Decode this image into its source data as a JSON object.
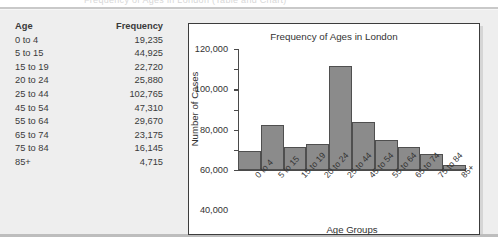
{
  "page": {
    "ghost_top_text": "Frequency of Ages in London (Table and Chart)"
  },
  "table": {
    "headers": [
      "Age",
      "Frequency"
    ],
    "rows": [
      {
        "age": "0 to 4",
        "frequency": "19,235"
      },
      {
        "age": "5 to 15",
        "frequency": "44,925"
      },
      {
        "age": "15 to 19",
        "frequency": "22,720"
      },
      {
        "age": "20 to 24",
        "frequency": "25,880"
      },
      {
        "age": "25 to 44",
        "frequency": "102,765"
      },
      {
        "age": "45 to 54",
        "frequency": "47,310"
      },
      {
        "age": "55 to 64",
        "frequency": "29,670"
      },
      {
        "age": "65 to 74",
        "frequency": "23,175"
      },
      {
        "age": "75 to 84",
        "frequency": "16,145"
      },
      {
        "age": "85+",
        "frequency": "4,715"
      }
    ]
  },
  "chart_data": {
    "type": "bar",
    "title": "Frequency of Ages in London",
    "xlabel": "Age Groups",
    "ylabel": "Number of Cases",
    "categories": [
      "0 to 4",
      "5 to 15",
      "15 to 19",
      "20 to 24",
      "25 to 44",
      "45 to 54",
      "55 to 64",
      "65 to 74",
      "75 to 84",
      "85+"
    ],
    "values": [
      19235,
      44925,
      22720,
      25880,
      102765,
      47310,
      29670,
      23175,
      16145,
      4715
    ],
    "ylim": [
      0,
      120000
    ],
    "ytick_values": [
      0,
      20000,
      40000,
      60000,
      80000,
      100000,
      120000
    ],
    "ytick_labels": [
      "0",
      "20,000",
      "40,000",
      "60,000",
      "80,000",
      "100,000",
      "120,000"
    ],
    "grid": false,
    "legend": false,
    "bar_color": "#8b8b8b",
    "bar_edge_color": "#4f4f4f",
    "contiguous_bars": true,
    "xtick_rotation_deg": -47
  },
  "colors": {
    "panel_bg": "#eeeeee",
    "card_bg": "#ffffff",
    "card_border": "#3c3c3c",
    "text": "#333333",
    "rule": "#c9c9c9"
  }
}
